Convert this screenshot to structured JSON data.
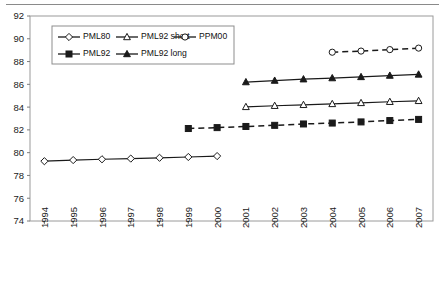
{
  "chart_data": {
    "type": "line",
    "title": "",
    "xlabel": "",
    "ylabel": "",
    "grid": false,
    "legend_position": "inside-top-left",
    "categories": [
      1994,
      1995,
      1996,
      1997,
      1998,
      1999,
      2000,
      2001,
      2002,
      2003,
      2004,
      2005,
      2006,
      2007
    ],
    "x_tick_labels": [
      "1994",
      "1995",
      "1996",
      "1997",
      "1998",
      "1999",
      "2000",
      "2001",
      "2002",
      "2003",
      "2004",
      "2005",
      "2006",
      "2007"
    ],
    "y_tick_labels": [
      "74",
      "76",
      "78",
      "80",
      "82",
      "84",
      "86",
      "88",
      "90",
      "92"
    ],
    "ylim": [
      74,
      92
    ],
    "ytick_step": 2,
    "series": [
      {
        "name": "PML80",
        "marker": "open-diamond",
        "linestyle": "solid",
        "x": [
          1994,
          1995,
          1996,
          1997,
          1998,
          1999,
          2000
        ],
        "values": [
          79.25,
          79.35,
          79.42,
          79.48,
          79.55,
          79.62,
          79.7
        ]
      },
      {
        "name": "PML92 short",
        "marker": "open-triangle",
        "linestyle": "solid",
        "x": [
          2001,
          2002,
          2003,
          2004,
          2005,
          2006,
          2007
        ],
        "values": [
          84.02,
          84.12,
          84.2,
          84.28,
          84.37,
          84.47,
          84.55
        ]
      },
      {
        "name": "PPM00",
        "marker": "open-circle",
        "linestyle": "dashed",
        "x": [
          2004,
          2005,
          2006,
          2007
        ],
        "values": [
          88.82,
          88.92,
          89.05,
          89.18
        ]
      },
      {
        "name": "PML92",
        "marker": "filled-square",
        "linestyle": "dashed",
        "x": [
          1999,
          2000,
          2001,
          2002,
          2003,
          2004,
          2005,
          2006,
          2007
        ],
        "values": [
          82.12,
          82.2,
          82.3,
          82.4,
          82.52,
          82.6,
          82.7,
          82.82,
          82.92
        ]
      },
      {
        "name": "PML92 long",
        "marker": "filled-triangle",
        "linestyle": "solid",
        "x": [
          2001,
          2002,
          2003,
          2004,
          2005,
          2006,
          2007
        ],
        "values": [
          86.2,
          86.33,
          86.45,
          86.55,
          86.65,
          86.77,
          86.87
        ]
      }
    ],
    "legend_rows": [
      [
        "PML80",
        "PML92 short",
        "PPM00"
      ],
      [
        "PML92",
        "PML92 long"
      ]
    ]
  }
}
